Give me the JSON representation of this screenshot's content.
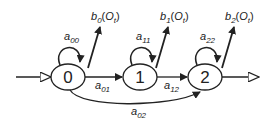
{
  "diagram": {
    "type": "HMM left-to-right state diagram",
    "states": [
      {
        "id": "0",
        "label": "0",
        "emission": {
          "base": "b",
          "sub": "0",
          "arg": "O",
          "argsub": "t"
        },
        "self_loop": {
          "base": "a",
          "sub": "00"
        }
      },
      {
        "id": "1",
        "label": "1",
        "emission": {
          "base": "b",
          "sub": "1",
          "arg": "O",
          "argsub": "t"
        },
        "self_loop": {
          "base": "a",
          "sub": "11"
        }
      },
      {
        "id": "2",
        "label": "2",
        "emission": {
          "base": "b",
          "sub": "2",
          "arg": "O",
          "argsub": "t"
        },
        "self_loop": {
          "base": "a",
          "sub": "22"
        }
      }
    ],
    "transitions": [
      {
        "from": "0",
        "to": "1",
        "base": "a",
        "sub": "01"
      },
      {
        "from": "1",
        "to": "2",
        "base": "a",
        "sub": "12"
      },
      {
        "from": "0",
        "to": "2",
        "base": "a",
        "sub": "02"
      }
    ],
    "entry": "input arrow into state 0",
    "exit": "output arrow from state 2",
    "colors": {
      "stroke": "#222222",
      "background": "#ffffff"
    }
  }
}
